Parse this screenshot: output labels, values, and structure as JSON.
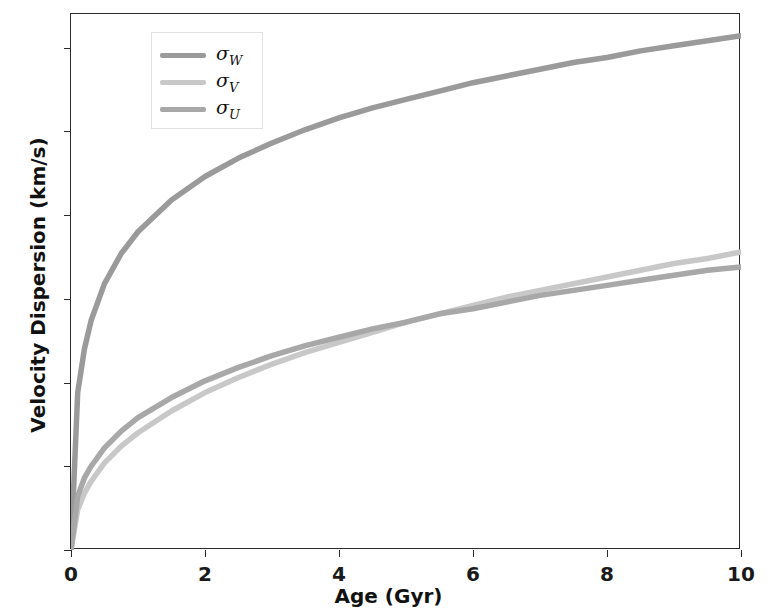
{
  "chart_data": {
    "type": "line",
    "title": "",
    "xlabel": "Age (Gyr)",
    "ylabel": "Velocity Dispersion (km/s)",
    "xlim": [
      0,
      10
    ],
    "ylim": [
      0,
      32
    ],
    "xticks": [
      0,
      2,
      4,
      6,
      8,
      10
    ],
    "yticks": [
      0,
      5,
      10,
      15,
      20,
      25,
      30
    ],
    "xtick_labels": [
      "0",
      "2",
      "4",
      "6",
      "8",
      "10"
    ],
    "ytick_labels": [
      "0",
      "5",
      "10",
      "15",
      "20",
      "25",
      "30"
    ],
    "grid": false,
    "legend_position": "upper left",
    "x": [
      0,
      0.1,
      0.2,
      0.3,
      0.5,
      0.75,
      1,
      1.5,
      2,
      2.5,
      3,
      3.5,
      4,
      4.5,
      5,
      5.5,
      6,
      6.5,
      7,
      7.5,
      8,
      8.5,
      9,
      9.5,
      10
    ],
    "series": [
      {
        "name": "sigma_W",
        "label": "σ",
        "sub": "W",
        "color": "#9a9a9a",
        "values": [
          0,
          9.4,
          12.0,
          13.7,
          15.9,
          17.7,
          19.0,
          20.9,
          22.3,
          23.4,
          24.3,
          25.1,
          25.8,
          26.4,
          26.9,
          27.4,
          27.9,
          28.3,
          28.7,
          29.1,
          29.4,
          29.8,
          30.1,
          30.4,
          30.7
        ]
      },
      {
        "name": "sigma_V",
        "label": "σ",
        "sub": "V",
        "color": "#c8c8c8",
        "values": [
          0,
          2.4,
          3.4,
          4.1,
          5.2,
          6.2,
          7.0,
          8.3,
          9.4,
          10.3,
          11.1,
          11.8,
          12.4,
          13.0,
          13.6,
          14.1,
          14.6,
          15.1,
          15.5,
          15.9,
          16.3,
          16.7,
          17.1,
          17.4,
          17.8
        ]
      },
      {
        "name": "sigma_U",
        "label": "σ",
        "sub": "U",
        "color": "#a8a8a8",
        "values": [
          0,
          3.2,
          4.3,
          5.0,
          6.1,
          7.1,
          7.9,
          9.1,
          10.1,
          10.9,
          11.6,
          12.2,
          12.7,
          13.2,
          13.6,
          14.1,
          14.4,
          14.8,
          15.2,
          15.5,
          15.8,
          16.1,
          16.4,
          16.7,
          16.9
        ]
      }
    ],
    "legend_entries": [
      {
        "name": "sigma_W",
        "label": "σ",
        "sub": "W",
        "color": "#9a9a9a"
      },
      {
        "name": "sigma_V",
        "label": "σ",
        "sub": "V",
        "color": "#c8c8c8"
      },
      {
        "name": "sigma_U",
        "label": "σ",
        "sub": "U",
        "color": "#a8a8a8"
      }
    ]
  }
}
